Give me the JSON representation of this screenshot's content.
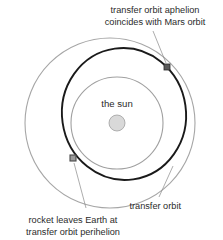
{
  "diagram": {
    "background_color": "#ffffff"
  },
  "labels": {
    "aphelion_line1": "transfer orbit aphelion",
    "aphelion_line2": "coincides with Mars orbit",
    "sun": "the sun",
    "transfer_orbit": "transfer orbit",
    "perihelion_line1": "rocket leaves Earth at",
    "perihelion_line2": "transfer orbit perihelion"
  },
  "colors": {
    "mars_orbit": "#a6a6a6",
    "earth_orbit": "#a0a0a0",
    "transfer_orbit": "#1a1a1a",
    "sun_fill": "#d9d9d9",
    "sun_stroke": "#a0a0a0",
    "earth_marker_fill": "#9a9a9a",
    "earth_marker_stroke": "#4a4a4a",
    "mars_marker_fill": "#5a5a5a",
    "mars_marker_stroke": "#2a2a2a",
    "leader_line": "#8a8a8a",
    "text": "#2b2b2b"
  },
  "geometry": {
    "mars_orbit": {
      "cx": 110,
      "cy": 123,
      "r": 85
    },
    "earth_orbit": {
      "cx": 117,
      "cy": 123,
      "r": 46
    },
    "transfer_orbit": {
      "cx": 124,
      "cy": 114,
      "rx": 62,
      "ry": 66,
      "rotation": -8
    },
    "sun": {
      "cx": 117,
      "cy": 123,
      "r": 8
    },
    "aphelion_marker": {
      "x": 167,
      "y": 67,
      "size": 6
    },
    "perihelion_marker": {
      "x": 73,
      "y": 158,
      "size": 6
    }
  }
}
